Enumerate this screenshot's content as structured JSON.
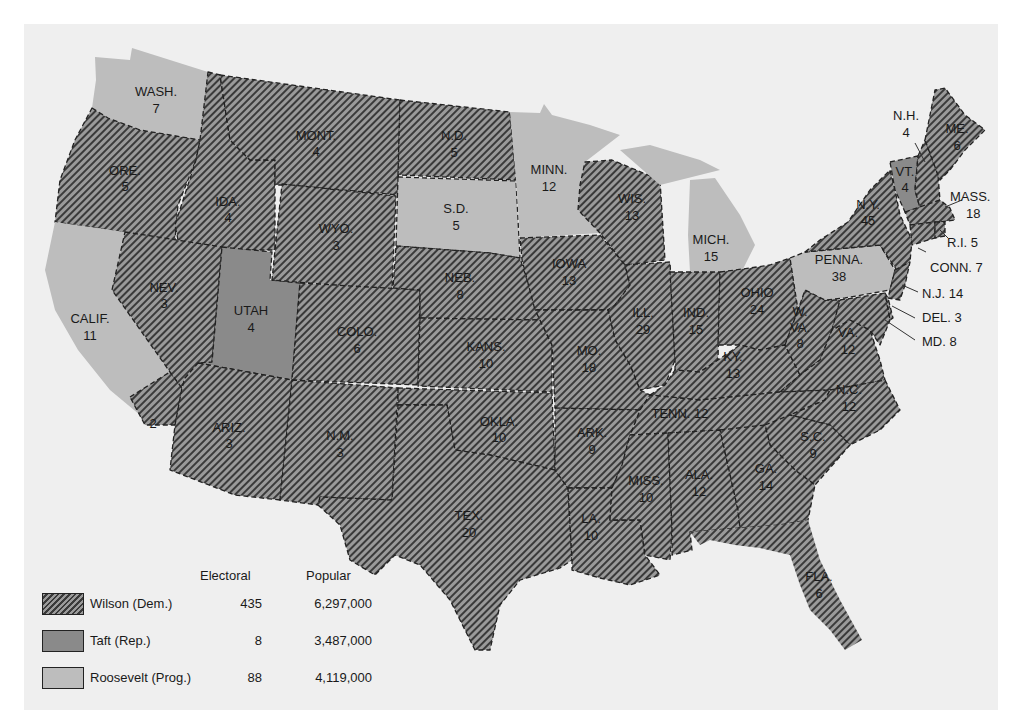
{
  "colors": {
    "background": "#efefef",
    "wilson_hatch_light": "#9a9a9a",
    "wilson_hatch_dark": "#3a3a3a",
    "taft": "#8a8a8a",
    "roosevelt": "#bdbdbd",
    "border": "#222222"
  },
  "legend": {
    "header_electoral": "Electoral",
    "header_popular": "Popular",
    "rows": [
      {
        "candidate": "Wilson (Dem.)",
        "party": "Dem.",
        "electoral": "435",
        "popular": "6,297,000",
        "pattern": "hatched"
      },
      {
        "candidate": "Taft (Rep.)",
        "party": "Rep.",
        "electoral": "8",
        "popular": "3,487,000",
        "pattern": "dark-gray"
      },
      {
        "candidate": "Roosevelt (Prog.)",
        "party": "Prog.",
        "electoral": "88",
        "popular": "4,119,000",
        "pattern": "light-gray"
      }
    ]
  },
  "states": {
    "wash": {
      "abbr": "WASH.",
      "votes": "7",
      "winner": "Roosevelt"
    },
    "ore": {
      "abbr": "ORE.",
      "votes": "5",
      "winner": "Wilson"
    },
    "calif": {
      "abbr": "CALIF.",
      "votes": "11",
      "winner": "Roosevelt"
    },
    "calif_south": {
      "abbr": "",
      "votes": "2",
      "winner": "Wilson"
    },
    "ida": {
      "abbr": "IDA.",
      "votes": "4",
      "winner": "Wilson"
    },
    "nev": {
      "abbr": "NEV.",
      "votes": "3",
      "winner": "Wilson"
    },
    "utah": {
      "abbr": "UTAH",
      "votes": "4",
      "winner": "Taft"
    },
    "ariz": {
      "abbr": "ARIZ.",
      "votes": "3",
      "winner": "Wilson"
    },
    "mont": {
      "abbr": "MONT.",
      "votes": "4",
      "winner": "Wilson"
    },
    "wyo": {
      "abbr": "WYO.",
      "votes": "3",
      "winner": "Wilson"
    },
    "colo": {
      "abbr": "COLO.",
      "votes": "6",
      "winner": "Wilson"
    },
    "nm": {
      "abbr": "N.M.",
      "votes": "3",
      "winner": "Wilson"
    },
    "nd": {
      "abbr": "N.D.",
      "votes": "5",
      "winner": "Wilson"
    },
    "sd": {
      "abbr": "S.D.",
      "votes": "5",
      "winner": "Roosevelt"
    },
    "neb": {
      "abbr": "NEB.",
      "votes": "8",
      "winner": "Wilson"
    },
    "kans": {
      "abbr": "KANS.",
      "votes": "10",
      "winner": "Wilson"
    },
    "okla": {
      "abbr": "OKLA.",
      "votes": "10",
      "winner": "Wilson"
    },
    "tex": {
      "abbr": "TEX.",
      "votes": "20",
      "winner": "Wilson"
    },
    "minn": {
      "abbr": "MINN.",
      "votes": "12",
      "winner": "Roosevelt"
    },
    "iowa": {
      "abbr": "IOWA",
      "votes": "13",
      "winner": "Wilson"
    },
    "mo": {
      "abbr": "MO.",
      "votes": "18",
      "winner": "Wilson"
    },
    "ark": {
      "abbr": "ARK.",
      "votes": "9",
      "winner": "Wilson"
    },
    "la": {
      "abbr": "LA.",
      "votes": "10",
      "winner": "Wilson"
    },
    "wis": {
      "abbr": "WIS.",
      "votes": "13",
      "winner": "Wilson"
    },
    "ill": {
      "abbr": "ILL.",
      "votes": "29",
      "winner": "Wilson"
    },
    "mich": {
      "abbr": "MICH.",
      "votes": "15",
      "winner": "Roosevelt"
    },
    "ind": {
      "abbr": "IND.",
      "votes": "15",
      "winner": "Wilson"
    },
    "ohio": {
      "abbr": "OHIO",
      "votes": "24",
      "winner": "Wilson"
    },
    "ky": {
      "abbr": "KY.",
      "votes": "13",
      "winner": "Wilson"
    },
    "tenn": {
      "label": "TENN. 12",
      "votes": "12",
      "winner": "Wilson"
    },
    "miss": {
      "abbr": "MISS.",
      "votes": "10",
      "winner": "Wilson"
    },
    "ala": {
      "abbr": "ALA.",
      "votes": "12",
      "winner": "Wilson"
    },
    "ga": {
      "abbr": "GA.",
      "votes": "14",
      "winner": "Wilson"
    },
    "fla": {
      "abbr": "FLA.",
      "votes": "6",
      "winner": "Wilson"
    },
    "sc": {
      "abbr": "S.C.",
      "votes": "9",
      "winner": "Wilson"
    },
    "nc": {
      "abbr": "N.C.",
      "votes": "12",
      "winner": "Wilson"
    },
    "va": {
      "abbr": "VA.",
      "votes": "12",
      "winner": "Wilson"
    },
    "wva": {
      "abbr1": "W.",
      "abbr2": "VA.",
      "votes": "8",
      "winner": "Wilson"
    },
    "penna": {
      "abbr": "PENNA.",
      "votes": "38",
      "winner": "Roosevelt"
    },
    "ny": {
      "abbr": "N.Y.",
      "votes": "45",
      "winner": "Wilson"
    },
    "vt": {
      "abbr": "VT.",
      "votes": "4",
      "winner": "Taft"
    },
    "nh": {
      "abbr": "N.H.",
      "votes": "4",
      "winner": "Wilson"
    },
    "me": {
      "abbr": "ME.",
      "votes": "6",
      "winner": "Wilson"
    },
    "mass": {
      "abbr": "MASS.",
      "votes": "18",
      "winner": "Wilson"
    },
    "ri": {
      "label": "R.I. 5",
      "votes": "5",
      "winner": "Wilson"
    },
    "conn": {
      "label": "CONN. 7",
      "votes": "7",
      "winner": "Wilson"
    },
    "nj": {
      "label": "N.J. 14",
      "votes": "14",
      "winner": "Wilson"
    },
    "del": {
      "label": "DEL. 3",
      "votes": "3",
      "winner": "Wilson"
    },
    "md": {
      "label": "MD. 8",
      "votes": "8",
      "winner": "Wilson"
    }
  }
}
